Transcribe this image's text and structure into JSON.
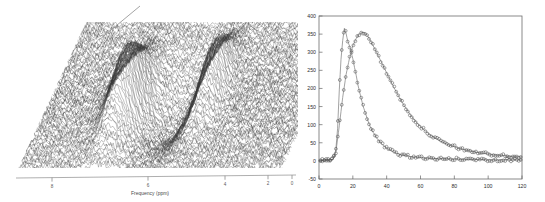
{
  "figure": {
    "background_color": "#ffffff",
    "panels": [
      "waterfall-3d",
      "decay-curves"
    ]
  },
  "left_panel": {
    "name": "3d-waterfall-spectrum",
    "xlabel": "Frequency (ppm)",
    "tick_labels": [
      "8",
      "6",
      "4",
      "2",
      "0"
    ],
    "tick_positions": [
      52,
      148,
      225,
      268,
      292
    ],
    "axis_color": "#8a8a8a",
    "mesh_color": "#3a3a3a",
    "pointer_line": true,
    "description": "Stacked-trace NMR waterfall mesh with noise floor and two resonance ridges"
  },
  "chart_data": [
    {
      "type": "line",
      "name": "3d-waterfall-spectrum",
      "title": "",
      "xlabel": "Frequency (ppm)",
      "ylabel": "",
      "xticks": [
        8,
        6,
        4,
        2,
        0
      ],
      "xlim": [
        8.6,
        -0.2
      ],
      "grid": false,
      "legend": "none",
      "notes": "Noisy 3D stacked spectral surface; two large downward/upward peak ridges near 6.2 ppm and 3.0 ppm"
    },
    {
      "type": "line",
      "name": "decay-curves",
      "title": "",
      "xlabel": "",
      "ylabel": "",
      "xlim": [
        0,
        120
      ],
      "ylim": [
        -50,
        400
      ],
      "xticks": [
        0,
        20,
        40,
        60,
        80,
        100,
        120
      ],
      "yticks": [
        -50,
        0,
        50,
        100,
        150,
        200,
        250,
        300,
        350,
        400
      ],
      "grid": false,
      "legend": "none",
      "marker": "open-circle",
      "series": [
        {
          "name": "series-1-narrow",
          "x": [
            0,
            2,
            4,
            6,
            8,
            9,
            10,
            11,
            12,
            13,
            14,
            15,
            16,
            17,
            18,
            19,
            20,
            21,
            22,
            23,
            24,
            25,
            26,
            27,
            28,
            29,
            30,
            32,
            34,
            36,
            38,
            40,
            42,
            44,
            46,
            48,
            50,
            54,
            58,
            62,
            66,
            70,
            74,
            78,
            82,
            86,
            90,
            95,
            100,
            105,
            110,
            115,
            120
          ],
          "values": [
            2,
            1,
            3,
            2,
            4,
            10,
            33,
            90,
            196,
            280,
            332,
            366,
            352,
            330,
            318,
            300,
            282,
            258,
            236,
            210,
            190,
            172,
            152,
            138,
            124,
            110,
            97,
            79,
            64,
            52,
            43,
            35,
            29,
            25,
            21,
            18,
            16,
            12,
            10,
            8,
            7,
            6,
            6,
            5,
            5,
            4,
            4,
            4,
            3,
            3,
            3,
            3,
            3
          ]
        },
        {
          "name": "series-2-broad",
          "x": [
            0,
            2,
            4,
            6,
            8,
            10,
            12,
            14,
            16,
            18,
            20,
            21,
            22,
            23,
            24,
            25,
            26,
            27,
            28,
            29,
            30,
            32,
            34,
            36,
            38,
            40,
            42,
            44,
            46,
            48,
            50,
            54,
            58,
            62,
            66,
            70,
            74,
            78,
            82,
            86,
            90,
            95,
            100,
            105,
            110,
            115,
            120
          ],
          "values": [
            1,
            1,
            2,
            2,
            3,
            25,
            97,
            175,
            238,
            283,
            318,
            328,
            338,
            346,
            351,
            354,
            355,
            353,
            349,
            343,
            335,
            318,
            300,
            281,
            262,
            243,
            224,
            205,
            188,
            171,
            155,
            127,
            104,
            86,
            71,
            59,
            50,
            42,
            36,
            31,
            27,
            22,
            19,
            16,
            14,
            12,
            11
          ]
        }
      ],
      "marker_color": "#555555",
      "line_color": "#7a7a7a",
      "axis_color": "#666666"
    }
  ]
}
